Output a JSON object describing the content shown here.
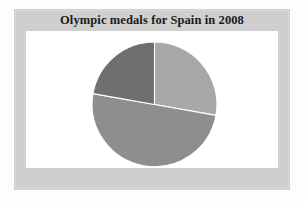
{
  "figure": {
    "title": "Olympic medals for Spain in 2008",
    "frame_color": "#cfcfcf",
    "plot_background": "#ffffff",
    "title_color": "#1b1b1b"
  },
  "chart_data": {
    "type": "pie",
    "title": "Olympic medals for Spain in 2008",
    "xlabel": "",
    "ylabel": "",
    "legend": false,
    "grid": false,
    "labels": [
      "Gold",
      "Silver",
      "Bronze"
    ],
    "values": [
      5,
      10,
      3
    ],
    "percentages": [
      27.8,
      55.6,
      16.7
    ],
    "colors": [
      "#a8a8a8",
      "#8e8e8e",
      "#6f6f6f"
    ],
    "start_angle_deg": 0,
    "direction": "clockwise",
    "total": 18,
    "slices": [
      {
        "label": "Gold",
        "value": 5,
        "percent": 27.8,
        "color": "#a8a8a8",
        "start_deg": 0,
        "end_deg": 100,
        "position": "top-right"
      },
      {
        "label": "Silver",
        "value": 10,
        "percent": 55.6,
        "color": "#8e8e8e",
        "start_deg": 100,
        "end_deg": 280,
        "position": "bottom"
      },
      {
        "label": "Bronze",
        "value": 3,
        "percent": 16.7,
        "color": "#6f6f6f",
        "start_deg": 280,
        "end_deg": 360,
        "position": "top-left"
      }
    ],
    "center_px": [
      154.5,
      104.5
    ],
    "radius_px": 62.5
  }
}
